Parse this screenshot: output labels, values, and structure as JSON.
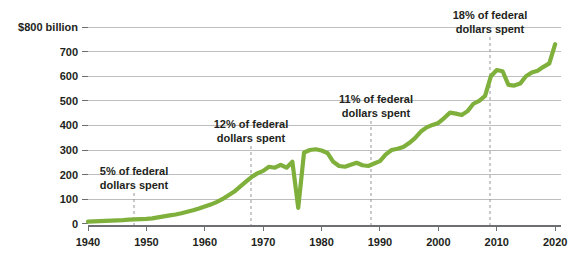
{
  "chart_data": {
    "type": "line",
    "title": "",
    "subtitle": "",
    "xlabel": "",
    "ylabel": "",
    "y_unit_label": "$800 billion",
    "xlim": [
      1940,
      2021
    ],
    "ylim": [
      0,
      800
    ],
    "grid": true,
    "legend": "none",
    "line_color": "#7fb03c",
    "x_ticks": [
      1940,
      1950,
      1960,
      1970,
      1980,
      1990,
      2000,
      2010,
      2020
    ],
    "x_tick_labels": [
      "1940",
      "1950",
      "1960",
      "1970",
      "1980",
      "1990",
      "2000",
      "2010",
      "2020"
    ],
    "y_ticks": [
      0,
      100,
      200,
      300,
      400,
      500,
      600,
      700,
      800
    ],
    "y_tick_labels": [
      "0",
      "100",
      "200",
      "300",
      "400",
      "500",
      "600",
      "700",
      "$800 billion"
    ],
    "x": [
      1940,
      1941,
      1942,
      1943,
      1944,
      1945,
      1946,
      1947,
      1948,
      1949,
      1950,
      1951,
      1952,
      1953,
      1954,
      1955,
      1956,
      1957,
      1958,
      1959,
      1960,
      1961,
      1962,
      1963,
      1964,
      1965,
      1966,
      1967,
      1968,
      1969,
      1970,
      1971,
      1972,
      1973,
      1974,
      1975,
      1976,
      1977,
      1978,
      1979,
      1980,
      1981,
      1982,
      1983,
      1984,
      1985,
      1986,
      1987,
      1988,
      1989,
      1990,
      1991,
      1992,
      1993,
      1994,
      1995,
      1996,
      1997,
      1998,
      1999,
      2000,
      2001,
      2002,
      2003,
      2004,
      2005,
      2006,
      2007,
      2008,
      2009,
      2010,
      2011,
      2012,
      2013,
      2014,
      2015,
      2016,
      2017,
      2018,
      2019,
      2020
    ],
    "values": [
      9,
      10,
      11,
      12,
      13,
      14,
      15,
      17,
      18,
      19,
      20,
      22,
      26,
      30,
      34,
      38,
      43,
      49,
      55,
      62,
      70,
      78,
      88,
      100,
      115,
      130,
      150,
      170,
      190,
      205,
      215,
      232,
      228,
      240,
      228,
      252,
      65,
      290,
      300,
      303,
      298,
      288,
      252,
      235,
      232,
      240,
      248,
      238,
      235,
      245,
      255,
      282,
      300,
      305,
      312,
      328,
      348,
      375,
      392,
      402,
      410,
      430,
      452,
      448,
      442,
      458,
      488,
      500,
      520,
      600,
      625,
      620,
      565,
      562,
      570,
      600,
      615,
      622,
      638,
      652,
      730
    ],
    "annotations": [
      {
        "label_lines": [
          "5% of federal",
          "dollars spent"
        ],
        "year": 1950,
        "percent": "5%",
        "text": "5% of federal dollars spent"
      },
      {
        "label_lines": [
          "12% of federal",
          "dollars spent"
        ],
        "year": 1970,
        "percent": "12%",
        "text": "12% of federal dollars spent"
      },
      {
        "label_lines": [
          "11% of federal",
          "dollars spent"
        ],
        "year": 1990,
        "percent": "11%",
        "text": "11% of federal dollars spent"
      },
      {
        "label_lines": [
          "18% of federal",
          "dollars spent"
        ],
        "year": 2010,
        "percent": "18%",
        "text": "18% of federal dollars spent"
      }
    ]
  }
}
